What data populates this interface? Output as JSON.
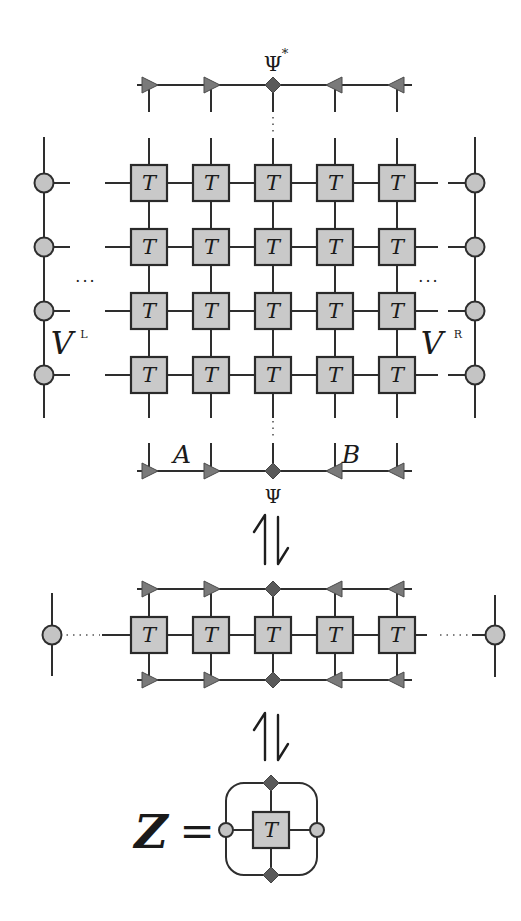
{
  "figure": {
    "tensor_label": "T",
    "top_mps_label": "Ψ",
    "top_mps_superscript": "*",
    "bottom_mps_label": "Ψ",
    "segment_a_label": "A",
    "segment_b_label": "B",
    "left_env_label": "V",
    "left_env_superscript": "L",
    "right_env_label": "V",
    "right_env_superscript": "R",
    "ellipsis": "···",
    "equivalence_symbol": "⥮",
    "partition_label": "Z",
    "equals": "="
  },
  "grid": {
    "rows": 4,
    "cols": 5,
    "col_x": [
      149,
      211,
      273,
      335,
      397
    ],
    "row_y": [
      183,
      247,
      311,
      375
    ]
  },
  "mps": {
    "markers": [
      "arrow-right",
      "arrow-right",
      "diamond",
      "arrow-left",
      "arrow-left"
    ]
  },
  "colors": {
    "tensor_fill": "#c9c9c9",
    "marker_fill": "#7a7a7a",
    "diamond_fill": "#5a5a5a",
    "line": "#2e2e2e"
  }
}
